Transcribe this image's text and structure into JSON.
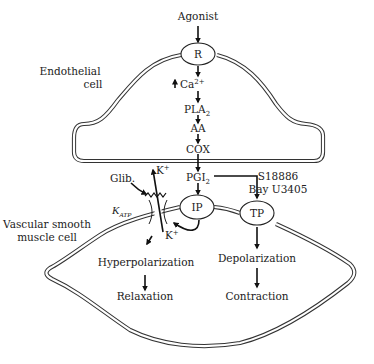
{
  "diagram": {
    "agonist": "Agonist",
    "receptor": "R",
    "calcium": "Ca",
    "calcium_sup": "2+",
    "pla2": "PLA",
    "pla2_sub": "2",
    "aa": "AA",
    "cox": "COX",
    "pgi2": "PGI",
    "pgi2_sub": "2",
    "ip_receptor": "IP",
    "tp_receptor": "TP",
    "endothelial_label_1": "Endothelial",
    "endothelial_label_2": "cell",
    "smc_label_1": "Vascular smooth",
    "smc_label_2": "muscle cell",
    "antagonist_1": "S18886",
    "antagonist_2": "Bay U3405",
    "glib": "Glib.",
    "k_out": "K",
    "k_in": "K",
    "k_sup": "+",
    "katp_k": "K",
    "katp_sub": "ATP",
    "hyperpolarization": "Hyperpolarization",
    "relaxation": "Relaxation",
    "depolarization": "Depolarization",
    "contraction": "Contraction",
    "colors": {
      "stroke": "#222222",
      "background": "#ffffff"
    }
  }
}
